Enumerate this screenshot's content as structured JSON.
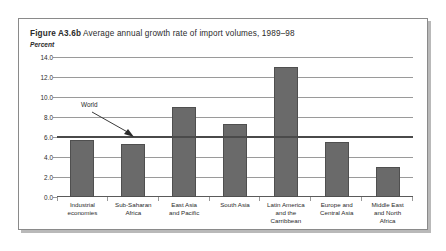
{
  "figure": {
    "number": "Figure A3.6b",
    "title": "Average annual growth rate of import volumes, 1989–98",
    "unit_label": "Percent"
  },
  "annotation": {
    "world_label": "World",
    "world_value": 6.0
  },
  "chart_data": {
    "type": "bar",
    "title": "Figure A3.6b  Average annual growth rate of import volumes, 1989–98",
    "xlabel": "",
    "ylabel": "Percent",
    "ylim": [
      0.0,
      14.0
    ],
    "yticks": [
      0.0,
      2.0,
      4.0,
      6.0,
      8.0,
      10.0,
      12.0,
      14.0
    ],
    "ytick_labels": [
      "0.0",
      "2.0",
      "4.0",
      "6.0",
      "8.0",
      "10.0",
      "12.0",
      "14.0"
    ],
    "grid": true,
    "legend": "none",
    "reference_lines": [
      {
        "label": "World",
        "value": 6.0
      }
    ],
    "categories": [
      "Industrial economies",
      "Sub-Saharan Africa",
      "East Asia and Pacific",
      "South Asia",
      "Latin America and the Carribbean",
      "Europe and Central Asia",
      "Middle East and North Africa"
    ],
    "category_lines": [
      [
        "Industrial",
        "economies"
      ],
      [
        "Sub-Saharan",
        "Africa"
      ],
      [
        "East Asia",
        "and Pacific"
      ],
      [
        "South Asia"
      ],
      [
        "Latin America",
        "and the",
        "Carribbean"
      ],
      [
        "Europe and",
        "Central Asia"
      ],
      [
        "Middle East",
        "and North",
        "Africa"
      ]
    ],
    "values": [
      5.7,
      5.3,
      9.0,
      7.3,
      13.0,
      5.5,
      3.0
    ],
    "bar_color": "#6a6a6a"
  }
}
